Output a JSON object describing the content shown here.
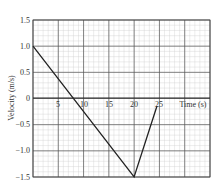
{
  "chart_data": {
    "type": "line",
    "title": "",
    "xlabel": "Time (s)",
    "ylabel": "Velocity (m/s)",
    "xlim": [
      0,
      35
    ],
    "ylim": [
      -1.5,
      1.5
    ],
    "x_ticks": [
      "5",
      "10",
      "15",
      "20",
      "25"
    ],
    "y_ticks": [
      "1.5",
      "1.0",
      "0.5",
      "0",
      "-0.5",
      "-1.0",
      "-1.5"
    ],
    "grid": true,
    "series": [
      {
        "name": "velocity",
        "x": [
          0,
          20,
          24.5
        ],
        "y": [
          1.0,
          -1.5,
          -0.15
        ]
      }
    ]
  },
  "labels": {
    "xaxis": "Time (s)",
    "yaxis": "Velocity (m/s)",
    "xticks": [
      "5",
      "10",
      "15",
      "20",
      "25"
    ],
    "yticks": [
      "1.5",
      "1.0",
      "0.5",
      "0",
      "−0.5",
      "−1.0",
      "−1.5"
    ]
  }
}
